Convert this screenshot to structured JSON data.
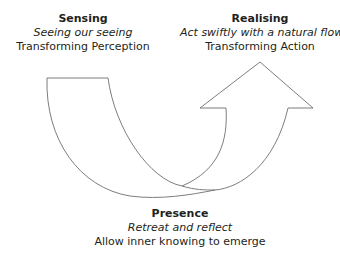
{
  "diagram": {
    "type": "u-shaped-flow-arrow",
    "stroke_color": "#6d6e71",
    "stages": {
      "sensing": {
        "title": "Sensing",
        "subtitle": "Seeing our seeing",
        "description": "Transforming Perception"
      },
      "presence": {
        "title": "Presence",
        "subtitle": "Retreat and reflect",
        "description": "Allow inner knowing to emerge"
      },
      "realising": {
        "title": "Realising",
        "subtitle": "Act swiftly with a natural flow",
        "description": "Transforming Action"
      }
    }
  }
}
